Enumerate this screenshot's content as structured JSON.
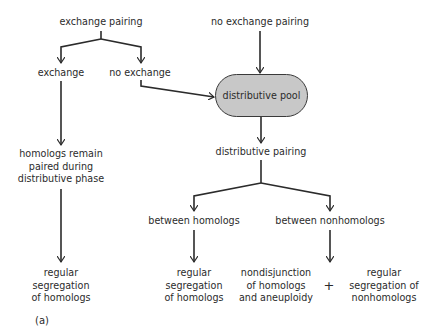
{
  "diagram": {
    "nodes": {
      "exchange_pairing": "exchange pairing",
      "no_exchange_pairing": "no exchange pairing",
      "exchange": "exchange",
      "no_exchange": "no exchange",
      "distributive_pool": "distributive pool",
      "homologs_remain": [
        "homologs remain",
        "paired during",
        "distributive phase"
      ],
      "distributive_pairing": "distributive pairing",
      "between_homologs": "between homologs",
      "between_nonhomologs": "between nonhomologs",
      "regular_seg_left": [
        "regular",
        "segregation",
        "of homologs"
      ],
      "regular_seg_mid": [
        "regular",
        "segregation",
        "of homologs"
      ],
      "nondisjunction": [
        "nondisjunction",
        "of homologs",
        "and aneuploidy"
      ],
      "plus": "+",
      "regular_seg_nonhomologs": [
        "regular",
        "segregation of",
        "nonhomologs"
      ]
    },
    "edges": [
      [
        "exchange pairing",
        "exchange"
      ],
      [
        "exchange pairing",
        "no exchange"
      ],
      [
        "no exchange pairing",
        "distributive pool"
      ],
      [
        "no exchange",
        "distributive pool"
      ],
      [
        "exchange",
        "homologs remain paired during distributive phase"
      ],
      [
        "homologs remain paired during distributive phase",
        "regular segregation of homologs"
      ],
      [
        "distributive pool",
        "distributive pairing"
      ],
      [
        "distributive pairing",
        "between homologs"
      ],
      [
        "distributive pairing",
        "between nonhomologs"
      ],
      [
        "between homologs",
        "regular segregation of homologs"
      ],
      [
        "between nonhomologs",
        "nondisjunction of homologs and aneuploidy + regular segregation of nonhomologs"
      ]
    ],
    "pool_fill": "#c8c8c8",
    "caption": "(a)"
  }
}
